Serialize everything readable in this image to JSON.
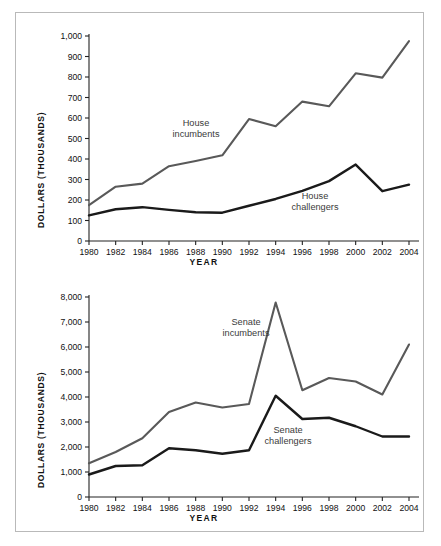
{
  "figure": {
    "cropped_top_text": "",
    "background_color": "#ffffff",
    "frame_color": "#b9b9b9"
  },
  "series_colors": {
    "incumbents": "#595959",
    "challengers": "#1a1a1a"
  },
  "chart_data": [
    {
      "id": "house",
      "type": "line",
      "title": "",
      "xlabel": "YEAR",
      "ylabel": "DOLLARS (THOUSANDS)",
      "x": [
        1980,
        1982,
        1984,
        1986,
        1988,
        1990,
        1992,
        1994,
        1996,
        1998,
        2000,
        2002,
        2004
      ],
      "xticklabels": [
        "1980",
        "1982",
        "1984",
        "1986",
        "1988",
        "1990",
        "1992",
        "1994",
        "1996",
        "1998",
        "2000",
        "2002",
        "2004"
      ],
      "yticks": [
        0,
        100,
        200,
        300,
        400,
        500,
        600,
        700,
        800,
        900,
        1000
      ],
      "yticklabels": [
        "0",
        "100",
        "200",
        "300",
        "400",
        "500",
        "600",
        "700",
        "800",
        "900",
        "1,000"
      ],
      "ylim": [
        0,
        1000
      ],
      "xlim": [
        1980,
        2004
      ],
      "grid": false,
      "legend": "inline-annotations",
      "series": [
        {
          "name": "House incumbents",
          "color": "#595959",
          "annotation": "House\nincumbents",
          "annotation_line1": "House",
          "annotation_line2": "incumbents",
          "values": [
            175,
            265,
            280,
            365,
            390,
            418,
            595,
            560,
            680,
            657,
            818,
            797,
            975
          ]
        },
        {
          "name": "House challengers",
          "color": "#1a1a1a",
          "annotation": "House\nchallengers",
          "annotation_line1": "House",
          "annotation_line2": "challengers",
          "values": [
            125,
            155,
            165,
            152,
            140,
            138,
            172,
            205,
            245,
            292,
            373,
            243,
            275
          ]
        }
      ]
    },
    {
      "id": "senate",
      "type": "line",
      "title": "",
      "xlabel": "YEAR",
      "ylabel": "DOLLARS (THOUSANDS)",
      "x": [
        1980,
        1982,
        1984,
        1986,
        1988,
        1990,
        1992,
        1994,
        1996,
        1998,
        2000,
        2002,
        2004
      ],
      "xticklabels": [
        "1980",
        "1982",
        "1984",
        "1986",
        "1988",
        "1990",
        "1992",
        "1994",
        "1996",
        "1998",
        "2000",
        "2002",
        "2004"
      ],
      "yticks": [
        0,
        1000,
        2000,
        3000,
        4000,
        5000,
        6000,
        7000,
        8000
      ],
      "yticklabels": [
        "0",
        "1,000",
        "2,000",
        "3,000",
        "4,000",
        "5,000",
        "6,000",
        "7,000",
        "8,000"
      ],
      "ylim": [
        0,
        8000
      ],
      "xlim": [
        1980,
        2004
      ],
      "grid": false,
      "legend": "inline-annotations",
      "series": [
        {
          "name": "Senate incumbents",
          "color": "#595959",
          "annotation": "Senate\nincumbents",
          "annotation_line1": "Senate",
          "annotation_line2": "incumbents",
          "values": [
            1350,
            1800,
            2350,
            3400,
            3780,
            3580,
            3720,
            7780,
            4270,
            4760,
            4620,
            4100,
            6100
          ]
        },
        {
          "name": "Senate challengers",
          "color": "#1a1a1a",
          "annotation": "Senate\nchallengers",
          "annotation_line1": "Senate",
          "annotation_line2": "challengers",
          "values": [
            900,
            1240,
            1270,
            1950,
            1870,
            1730,
            1870,
            4050,
            3120,
            3170,
            2830,
            2420,
            2420
          ]
        }
      ]
    }
  ]
}
